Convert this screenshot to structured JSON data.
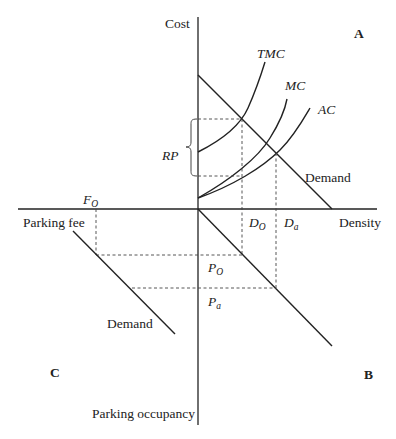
{
  "diagram": {
    "axes": {
      "cost": "Cost",
      "density": "Density",
      "parking_fee": "Parking fee",
      "parking_occupancy": "Parking occupancy"
    },
    "quadrants": {
      "a": "A",
      "b": "B",
      "c": "C"
    },
    "curves": {
      "tmc": "TMC",
      "mc": "MC",
      "ac": "AC",
      "demand_a": "Demand",
      "demand_c": "Demand"
    },
    "labels": {
      "rp": "RP",
      "f_base": "F",
      "f_sub": "O",
      "do_base": "D",
      "do_sub": "O",
      "da_base": "D",
      "da_sub": "a",
      "po_base": "P",
      "po_sub": "O",
      "pa_base": "P",
      "pa_sub": "a"
    }
  }
}
